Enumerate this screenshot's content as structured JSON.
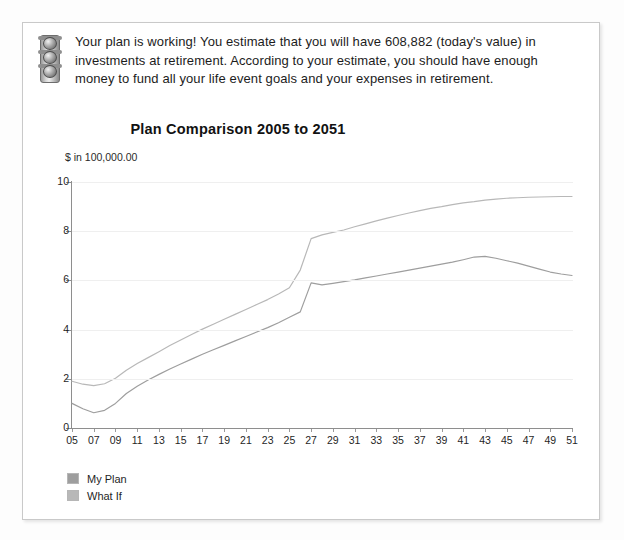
{
  "notice": {
    "icon": "traffic-light-icon",
    "text": "Your plan is working! You estimate that you will have 608,882 (today's value) in investments at retirement. According to your estimate, you should have enough money to fund all your life event goals and your expenses in retirement."
  },
  "legend": {
    "items": [
      {
        "label": "My Plan",
        "color": "#9e9e9e"
      },
      {
        "label": "What If",
        "color": "#b8b8b8"
      }
    ]
  },
  "chart_data": {
    "type": "line",
    "title": "Plan Comparison 2005 to 2051",
    "xlabel": "",
    "ylabel": "$ in 100,000.00",
    "ylim": [
      0,
      10
    ],
    "yticks": [
      0,
      2,
      4,
      6,
      8,
      10
    ],
    "ytick_labels": [
      "0",
      "2",
      "4",
      "6",
      "8",
      "10"
    ],
    "grid": true,
    "legend_position": "bottom-left",
    "x": [
      5,
      6,
      7,
      8,
      9,
      10,
      11,
      12,
      13,
      14,
      15,
      16,
      17,
      18,
      19,
      20,
      21,
      22,
      23,
      24,
      25,
      26,
      27,
      28,
      29,
      30,
      31,
      32,
      33,
      34,
      35,
      36,
      37,
      38,
      39,
      40,
      41,
      42,
      43,
      44,
      45,
      46,
      47,
      48,
      49,
      50,
      51
    ],
    "xtick_labels": [
      "05",
      "07",
      "09",
      "11",
      "13",
      "15",
      "17",
      "19",
      "21",
      "23",
      "25",
      "27",
      "29",
      "31",
      "33",
      "35",
      "37",
      "39",
      "41",
      "43",
      "45",
      "47",
      "49",
      "51"
    ],
    "series": [
      {
        "name": "What If",
        "color": "#b8b8b8",
        "values": [
          1.9,
          1.78,
          1.72,
          1.8,
          2.02,
          2.35,
          2.62,
          2.86,
          3.1,
          3.35,
          3.58,
          3.8,
          4.02,
          4.22,
          4.42,
          4.62,
          4.82,
          5.02,
          5.22,
          5.45,
          5.7,
          6.42,
          7.7,
          7.85,
          7.95,
          8.05,
          8.18,
          8.3,
          8.42,
          8.53,
          8.64,
          8.74,
          8.84,
          8.93,
          9.0,
          9.08,
          9.15,
          9.2,
          9.26,
          9.3,
          9.34,
          9.36,
          9.38,
          9.39,
          9.4,
          9.41,
          9.41
        ]
      },
      {
        "name": "My Plan",
        "color": "#9e9e9e",
        "values": [
          1.0,
          0.78,
          0.62,
          0.72,
          1.0,
          1.4,
          1.7,
          1.95,
          2.18,
          2.4,
          2.6,
          2.8,
          3.0,
          3.18,
          3.36,
          3.54,
          3.72,
          3.9,
          4.08,
          4.28,
          4.5,
          4.72,
          5.9,
          5.82,
          5.88,
          5.95,
          6.02,
          6.1,
          6.18,
          6.26,
          6.34,
          6.42,
          6.5,
          6.58,
          6.66,
          6.74,
          6.84,
          6.95,
          6.98,
          6.9,
          6.8,
          6.7,
          6.58,
          6.46,
          6.34,
          6.26,
          6.2
        ]
      }
    ]
  }
}
